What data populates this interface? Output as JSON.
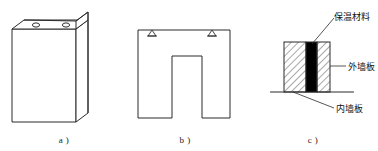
{
  "figure": {
    "panels": [
      {
        "id": "a",
        "caption": "a )",
        "description": "three-dimensional wall panel block with two lifting holes on top face",
        "features": {
          "hole_count": 2,
          "hole_label": "lifting-hole"
        }
      },
      {
        "id": "b",
        "caption": "b )",
        "description": "front elevation of U-shaped wall panel with two lifting anchor marks",
        "features": {
          "anchor_count": 2,
          "anchor_label": "lifting-anchor-triangle"
        }
      },
      {
        "id": "c",
        "caption": "c )",
        "description": "horizontal cross-section of sandwich wall panel showing three layers",
        "labels": [
          {
            "key": "insulation",
            "text": "保温材料",
            "position": "top-right"
          },
          {
            "key": "exterior_panel",
            "text": "外墙板",
            "position": "middle-right"
          },
          {
            "key": "interior_panel",
            "text": "内墙板",
            "position": "bottom-right"
          }
        ],
        "layers": [
          {
            "key": "hatched-left",
            "fill": "hatch"
          },
          {
            "key": "solid-core",
            "fill": "#000000"
          },
          {
            "key": "hatched-right",
            "fill": "hatch"
          }
        ]
      }
    ],
    "colors": {
      "stroke": "#2b2b2b",
      "core_fill": "#000000",
      "background": "#ffffff"
    }
  }
}
